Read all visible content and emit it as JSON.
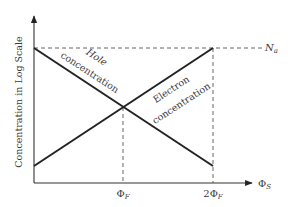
{
  "diagram": {
    "y_axis_label": "Concentration in Log Scale",
    "x_axis_symbol": "Φ",
    "x_axis_subscript": "S",
    "na_symbol": "N",
    "na_subscript": "a",
    "ticks": [
      {
        "prefix": "",
        "symbol": "Φ",
        "subscript": "F",
        "value": 1
      },
      {
        "prefix": "2",
        "symbol": "Φ",
        "subscript": "F",
        "value": 2
      }
    ],
    "hole_label": {
      "line1": "Hole",
      "line2": "concentration"
    },
    "electron_label": {
      "line1": "Electron",
      "line2": "concentration"
    },
    "curves": {
      "hole": {
        "from": [
          0,
          "Na"
        ],
        "to": [
          2,
          "low"
        ],
        "trend": "decreasing"
      },
      "electron": {
        "from": [
          0,
          "low"
        ],
        "to": [
          2,
          "Na"
        ],
        "trend": "increasing"
      },
      "intersection_at": 1
    }
  }
}
